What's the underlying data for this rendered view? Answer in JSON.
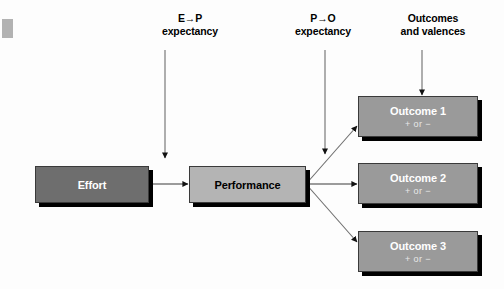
{
  "diagram": {
    "background_color": "#fdfdfd",
    "captions": [
      {
        "name": "e-p-expectancy",
        "line1": "E→P",
        "line2": "expectancy"
      },
      {
        "name": "p-o-expectancy",
        "line1": "P→O",
        "line2": "expectancy"
      },
      {
        "name": "outcomes-and-valences",
        "line1": "Outcomes",
        "line2": "and valences"
      }
    ],
    "boxes": [
      {
        "name": "effort-box",
        "title": "Effort",
        "subtitle": "",
        "fill": "#6e6e6e",
        "text_color": "#ffffff"
      },
      {
        "name": "performance-box",
        "title": "Performance",
        "subtitle": "",
        "fill": "#b4b4b4",
        "text_color": "#000000"
      },
      {
        "name": "outcome-1-box",
        "title": "Outcome 1",
        "subtitle": "+ or −",
        "fill": "#9a9a9a",
        "text_color": "#ffffff"
      },
      {
        "name": "outcome-2-box",
        "title": "Outcome 2",
        "subtitle": "+ or −",
        "fill": "#9a9a9a",
        "text_color": "#ffffff"
      },
      {
        "name": "outcome-3-box",
        "title": "Outcome 3",
        "subtitle": "+ or −",
        "fill": "#9a9a9a",
        "text_color": "#ffffff"
      }
    ],
    "arrows": [
      {
        "name": "arrow-e-p-expectancy-down",
        "kind": "vertical"
      },
      {
        "name": "arrow-p-o-expectancy-down",
        "kind": "vertical"
      },
      {
        "name": "arrow-outcomes-valences-down",
        "kind": "vertical"
      },
      {
        "name": "arrow-effort-to-performance",
        "kind": "horizontal"
      },
      {
        "name": "arrow-performance-to-outcome-1",
        "kind": "diagonal-up"
      },
      {
        "name": "arrow-performance-to-outcome-2",
        "kind": "horizontal"
      },
      {
        "name": "arrow-performance-to-outcome-3",
        "kind": "diagonal-down"
      }
    ],
    "shadow_color": "#000000",
    "line_color": "#555555"
  }
}
